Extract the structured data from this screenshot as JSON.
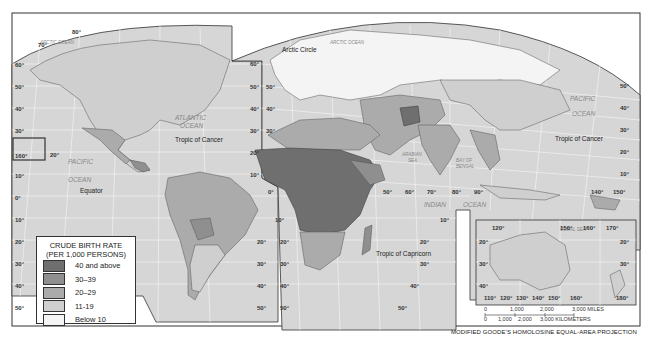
{
  "map": {
    "title": "World Crude Birth Rate",
    "projection_note": "MODIFIED GOODE'S HOMOLOSINE EQUAL-AREA PROJECTION",
    "colors": {
      "ocean": "#d6d6d6",
      "grid": "#f2f2f2",
      "border": "#333333",
      "c40plus": "#6f6f6f",
      "c30_39": "#8f8f8f",
      "c20_29": "#ababab",
      "c11_19": "#cfcfcf",
      "below10": "#f4f4f4"
    },
    "ocean_labels": [
      {
        "text": "ARCTIC OCEAN",
        "x": 58,
        "y": 44
      },
      {
        "text": "ATLANTIC",
        "x": 182,
        "y": 120
      },
      {
        "text": "OCEAN",
        "x": 182,
        "y": 128
      },
      {
        "text": "PACIFIC",
        "x": 84,
        "y": 162
      },
      {
        "text": "OCEAN",
        "x": 84,
        "y": 180
      },
      {
        "text": "ARCTIC OCEAN",
        "x": 335,
        "y": 42
      },
      {
        "text": "PACIFIC",
        "x": 585,
        "y": 101
      },
      {
        "text": "OCEAN",
        "x": 585,
        "y": 116
      },
      {
        "text": "INDIAN",
        "x": 432,
        "y": 207
      },
      {
        "text": "OCEAN",
        "x": 480,
        "y": 207
      },
      {
        "text": "ARABIAN",
        "x": 408,
        "y": 155
      },
      {
        "text": "SEA",
        "x": 412,
        "y": 161
      },
      {
        "text": "BAY OF",
        "x": 467,
        "y": 162
      },
      {
        "text": "BENGAL",
        "x": 467,
        "y": 168
      },
      {
        "text": "CORAL SEA",
        "x": 576,
        "y": 229
      }
    ],
    "line_labels": [
      {
        "text": "Arctic Circle",
        "x": 283,
        "y": 51
      },
      {
        "text": "Tropic of Cancer",
        "x": 200,
        "y": 141
      },
      {
        "text": "Equator",
        "x": 95,
        "y": 193
      },
      {
        "text": "Tropic of Cancer",
        "x": 583,
        "y": 141
      },
      {
        "text": "Tropic of Capricorn",
        "x": 419,
        "y": 257
      }
    ],
    "lat_labels_left": [
      "80°",
      "70°",
      "60°",
      "50°",
      "40°",
      "30°",
      "20°",
      "10°",
      "0°",
      "10°",
      "20°",
      "30°",
      "40°",
      "50°"
    ],
    "lon_labels": [
      "0°",
      "50°",
      "60°",
      "70°",
      "80°",
      "90°",
      "140°",
      "150°",
      "160°"
    ],
    "australia_inset": {
      "top_labels": [
        "120°",
        "150°",
        "160°",
        "170°"
      ],
      "bottom_labels": [
        "110°",
        "120°",
        "130°",
        "140°",
        "150°",
        "160°",
        "180°"
      ],
      "lat_labels": [
        "20°",
        "30°",
        "40°"
      ]
    },
    "hawaii_inset_label": "160°"
  },
  "legend": {
    "title_line1": "CRUDE BIRTH RATE",
    "title_line2": "(PER 1,000 PERSONS)",
    "items": [
      {
        "label": "40 and above",
        "color": "#6f6f6f"
      },
      {
        "label": "30–39",
        "color": "#8f8f8f"
      },
      {
        "label": "20–29",
        "color": "#ababab"
      },
      {
        "label": "11-19",
        "color": "#cfcfcf"
      },
      {
        "label": "Below 10",
        "color": "#f4f4f4"
      }
    ]
  },
  "scale_bar": {
    "miles_ticks": [
      "0",
      "1,000",
      "2,000",
      "3,000 MILES"
    ],
    "km_ticks": [
      "0",
      "1,000",
      "2,000",
      "3,000 KILOMETERS"
    ]
  }
}
